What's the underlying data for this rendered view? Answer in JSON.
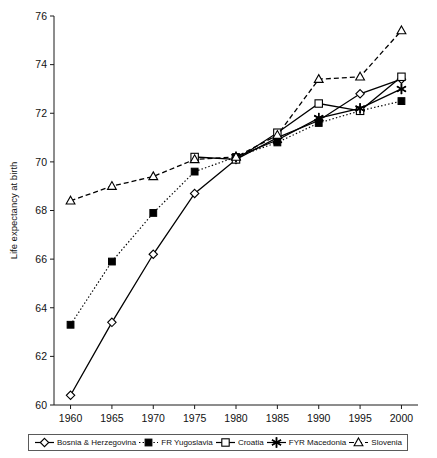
{
  "chart_data": {
    "type": "line",
    "title": "",
    "xlabel": "",
    "ylabel": "Life expectancy at birth",
    "x": [
      1960,
      1965,
      1970,
      1975,
      1980,
      1985,
      1990,
      1995,
      2000
    ],
    "xticklabels": [
      "1960",
      "1965",
      "1970",
      "1975",
      "1980",
      "1985",
      "1990",
      "1995",
      "2000"
    ],
    "yticklabels": [
      "60",
      "62",
      "64",
      "66",
      "68",
      "70",
      "72",
      "74",
      "76"
    ],
    "yticks": [
      60,
      62,
      64,
      66,
      68,
      70,
      72,
      74,
      76
    ],
    "xlim": [
      1958,
      2002
    ],
    "ylim": [
      60,
      76
    ],
    "grid": false,
    "legend_position": "bottom",
    "series": [
      {
        "name": "Bosnia & Herzegovina",
        "marker": "open-diamond",
        "line": "solid",
        "x": [
          1960,
          1965,
          1970,
          1975,
          1980,
          1985,
          1990,
          1995,
          2000
        ],
        "values": [
          60.4,
          63.4,
          66.2,
          68.7,
          70.1,
          71.0,
          71.7,
          72.8,
          73.4
        ]
      },
      {
        "name": "FR Yugoslavia",
        "marker": "filled-square",
        "line": "dotted",
        "x": [
          1960,
          1965,
          1970,
          1975,
          1980,
          1985,
          1990,
          1995,
          2000
        ],
        "values": [
          63.3,
          65.9,
          67.9,
          69.6,
          70.2,
          70.8,
          71.6,
          72.1,
          72.5
        ]
      },
      {
        "name": "Croatia",
        "marker": "open-square",
        "line": "solid",
        "x": [
          1975,
          1980,
          1985,
          1990,
          1995,
          2000
        ],
        "values": [
          70.2,
          70.1,
          71.2,
          72.4,
          72.1,
          73.5
        ]
      },
      {
        "name": "FYR Macedonia",
        "marker": "star",
        "line": "solid",
        "x": [
          1980,
          1985,
          1990,
          1995,
          2000
        ],
        "values": [
          70.2,
          70.9,
          71.8,
          72.2,
          73.0
        ]
      },
      {
        "name": "Slovenia",
        "marker": "open-triangle",
        "line": "dashed",
        "x": [
          1960,
          1965,
          1970,
          1975,
          1980,
          1985,
          1990,
          1995,
          2000
        ],
        "values": [
          68.4,
          69.0,
          69.4,
          70.1,
          70.2,
          71.1,
          73.4,
          73.5,
          75.4
        ]
      }
    ]
  },
  "legend": {
    "items": [
      {
        "label": "Bosnia & Herzegovina",
        "marker": "open-diamond",
        "line": "solid"
      },
      {
        "label": "FR Yugoslavia",
        "marker": "filled-square",
        "line": "dotted"
      },
      {
        "label": "Croatia",
        "marker": "open-square",
        "line": "solid"
      },
      {
        "label": "FYR Macedonia",
        "marker": "star",
        "line": "solid"
      },
      {
        "label": "Slovenia",
        "marker": "open-triangle",
        "line": "dashed"
      }
    ]
  },
  "colors": {
    "ink": "#000000",
    "axis": "#1a1a1a",
    "background": "#ffffff",
    "legend_border": "#5a5a5a"
  }
}
